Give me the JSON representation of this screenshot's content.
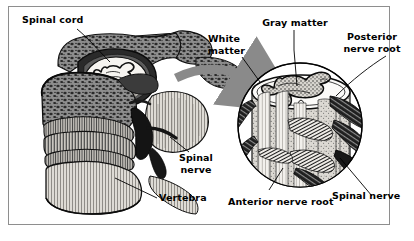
{
  "figure": {
    "background_color": "#ffffff",
    "frame_color": "#8e8e8e",
    "ink_color": "#000000",
    "arrow_color": "#8a8a8a"
  },
  "labels": {
    "spinal_cord": "Spinal cord",
    "white_matter_line1": "White",
    "white_matter_line2": "matter",
    "gray_matter": "Gray matter",
    "posterior_nerve_root_line1": "Posterior",
    "posterior_nerve_root_line2": "nerve root",
    "spinal_nerve_left_line1": "Spinal",
    "spinal_nerve_left_line2": "nerve",
    "vertebra": "Vertebra",
    "anterior_nerve_root": "Anterior nerve root",
    "spinal_nerve_right": "Spinal nerve"
  },
  "panels": {
    "left_panel_name": "vertebral-column-cutaway",
    "right_panel_name": "magnified-spinal-cord-segment",
    "magnifier_circle": {
      "cx": 300,
      "cy": 125,
      "r": 63
    },
    "zoom_arrow": {
      "from_x": 178,
      "from_y": 80,
      "to_x": 256,
      "to_y": 86
    }
  }
}
